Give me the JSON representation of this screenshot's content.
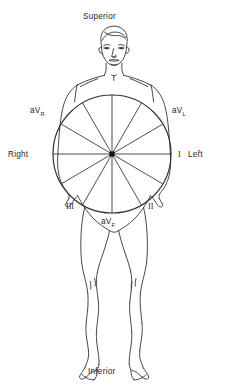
{
  "diagram": {
    "orientation_labels": {
      "superior": "Superior",
      "inferior": "Inferior",
      "right": "Right",
      "left": "Left"
    },
    "lead_labels": {
      "lead_1": "I",
      "lead_2": "II",
      "lead_3": "III",
      "avr_prefix": "aV",
      "avr_sub": "R",
      "avl_prefix": "aV",
      "avl_sub": "L",
      "avf_prefix": "aV",
      "avf_sub": "F"
    },
    "colors": {
      "ink": "#25252a",
      "line": "#3a3a3f",
      "background": "#ffffff"
    },
    "circle": {
      "center_x": 112,
      "center_y": 154,
      "radius": 59
    },
    "axes": [
      {
        "name": "lead-I",
        "angle_deg": 0,
        "label": "I"
      },
      {
        "name": "lead-II",
        "angle_deg": 60,
        "label": "II"
      },
      {
        "name": "lead-III",
        "angle_deg": 120,
        "label": "III"
      },
      {
        "name": "lead-aVR",
        "angle_deg": -150,
        "label": "aVR"
      },
      {
        "name": "lead-aVL",
        "angle_deg": -30,
        "label": "aVL"
      },
      {
        "name": "lead-aVF",
        "angle_deg": 90,
        "label": "aVF"
      }
    ]
  }
}
